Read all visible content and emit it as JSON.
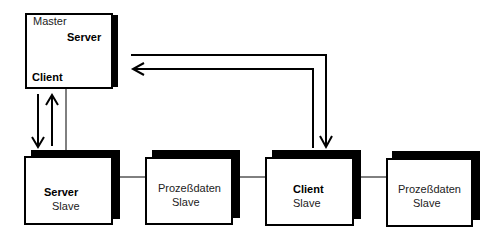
{
  "diagram": {
    "type": "network-topology",
    "master": {
      "title": "Master",
      "server_label": "Server",
      "client_label": "Client"
    },
    "slaves": [
      {
        "id": "server-slave",
        "role": "Server",
        "type": "Slave"
      },
      {
        "id": "prozessdaten-slave-1",
        "role": "Prozeßdaten",
        "type": "Slave"
      },
      {
        "id": "client-slave",
        "role": "Client",
        "type": "Slave"
      },
      {
        "id": "prozessdaten-slave-2",
        "role": "Prozeßdaten",
        "type": "Slave"
      }
    ],
    "connections": [
      {
        "from": "master",
        "to": "server-slave",
        "kind": "bus-line"
      },
      {
        "from": "server-slave",
        "to": "prozessdaten-slave-1",
        "kind": "bus-line"
      },
      {
        "from": "prozessdaten-slave-1",
        "to": "client-slave",
        "kind": "bus-line"
      },
      {
        "from": "client-slave",
        "to": "prozessdaten-slave-2",
        "kind": "bus-line"
      }
    ],
    "flows": [
      {
        "from": "master-client",
        "to": "server-slave",
        "direction": "down"
      },
      {
        "from": "server-slave",
        "to": "master",
        "direction": "up"
      },
      {
        "from": "master-server",
        "to": "client-slave",
        "direction": "right-then-down"
      },
      {
        "from": "client-slave",
        "to": "master-server",
        "direction": "up-then-left"
      }
    ],
    "colors": {
      "line": "#000000",
      "shadow": "#000000",
      "box_fill": "#ffffff",
      "text": "#222222"
    }
  }
}
